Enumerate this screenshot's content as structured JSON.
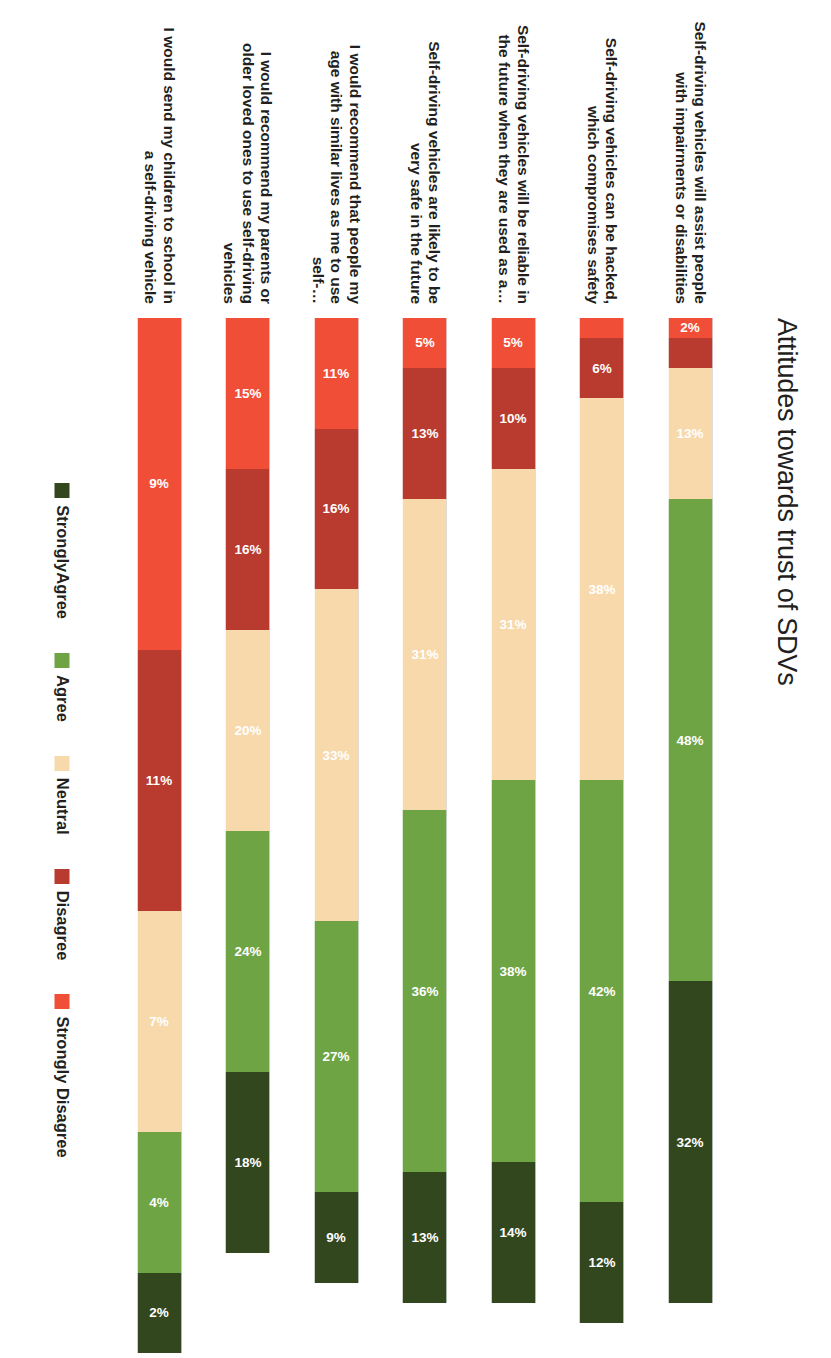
{
  "title": "Attitudes towards trust of SDVs",
  "legend": {
    "position": "bottom",
    "items": [
      {
        "label": "Strongly Disagree",
        "color": "#F04E37"
      },
      {
        "label": "Disagree",
        "color": "#B93A2E"
      },
      {
        "label": "Neutral",
        "color": "#F7D9AC"
      },
      {
        "label": "Agree",
        "color": "#6FA444"
      },
      {
        "label": "StronglyAgree",
        "color": "#33471F"
      }
    ]
  },
  "chart_data": {
    "type": "bar",
    "orientation": "stacked-horizontal-rotated",
    "title": "Attitudes towards trust of SDVs",
    "xlabel": "",
    "ylabel": "",
    "grid": false,
    "legend_position": "bottom",
    "value_suffix": "%",
    "categories": [
      "Self-driving vehicles will assist people with impairments or disabilities",
      "Self-driving vehicles can be hacked, which compromises safety",
      "Self-driving vehicles will be reliable in the future when they are used as a…",
      "Self-driving vehicles are likely to be very safe in the future",
      "I would recommend that people my age with similar lives as me to use self-…",
      "I would recommend my parents or older loved ones to use self-driving vehicles",
      "I would send my children to school in a self-driving vehicle"
    ],
    "series": [
      {
        "name": "Strongly Disagree",
        "color": "#F04E37",
        "values": [
          2,
          2,
          5,
          5,
          11,
          15,
          9
        ],
        "labels": [
          "2%",
          "2%",
          "5%",
          "5%",
          "11%",
          "15%",
          "9%"
        ]
      },
      {
        "name": "Disagree",
        "color": "#B93A2E",
        "values": [
          3,
          6,
          10,
          13,
          16,
          16,
          11
        ],
        "labels": [
          "",
          "6%",
          "10%",
          "13%",
          "16%",
          "16%",
          "11%"
        ]
      },
      {
        "name": "Neutral",
        "color": "#F7D9AC",
        "values": [
          13,
          38,
          31,
          31,
          33,
          20,
          7
        ],
        "labels": [
          "13%",
          "38%",
          "31%",
          "31%",
          "33%",
          "20%",
          "7%"
        ]
      },
      {
        "name": "Agree",
        "color": "#6FA444",
        "values": [
          48,
          42,
          38,
          36,
          27,
          24,
          4
        ],
        "labels": [
          "48%",
          "42%",
          "38%",
          "36%",
          "27%",
          "24%",
          "4%"
        ]
      },
      {
        "name": "StronglyAgree",
        "color": "#33471F",
        "values": [
          32,
          12,
          14,
          13,
          9,
          18,
          2
        ],
        "labels": [
          "32%",
          "12%",
          "14%",
          "13%",
          "9%",
          "18%",
          "2%"
        ]
      }
    ]
  },
  "rows": [
    {
      "label": "Self-driving vehicles will assist people with impairments or disabilities",
      "segments": [
        {
          "name": "Strongly Disagree",
          "color": "#F04E37",
          "value": 2,
          "label": "2%",
          "show": true
        },
        {
          "name": "Disagree",
          "color": "#B93A2E",
          "value": 3,
          "label": "",
          "show": false
        },
        {
          "name": "Neutral",
          "color": "#F7D9AC",
          "value": 13,
          "label": "13%",
          "show": true
        },
        {
          "name": "Agree",
          "color": "#6FA444",
          "value": 48,
          "label": "48%",
          "show": true
        },
        {
          "name": "StronglyAgree",
          "color": "#33471F",
          "value": 32,
          "label": "32%",
          "show": true
        }
      ]
    },
    {
      "label": "Self-driving vehicles can be hacked, which compromises safety",
      "segments": [
        {
          "name": "Strongly Disagree",
          "color": "#F04E37",
          "value": 2,
          "label": "2%",
          "show": false
        },
        {
          "name": "Disagree",
          "color": "#B93A2E",
          "value": 6,
          "label": "6%",
          "show": true
        },
        {
          "name": "Neutral",
          "color": "#F7D9AC",
          "value": 38,
          "label": "38%",
          "show": true
        },
        {
          "name": "Agree",
          "color": "#6FA444",
          "value": 42,
          "label": "42%",
          "show": true
        },
        {
          "name": "StronglyAgree",
          "color": "#33471F",
          "value": 12,
          "label": "12%",
          "show": true
        }
      ]
    },
    {
      "label": "Self-driving vehicles will be reliable in the future when they are used as a…",
      "segments": [
        {
          "name": "Strongly Disagree",
          "color": "#F04E37",
          "value": 5,
          "label": "5%",
          "show": true
        },
        {
          "name": "Disagree",
          "color": "#B93A2E",
          "value": 10,
          "label": "10%",
          "show": true
        },
        {
          "name": "Neutral",
          "color": "#F7D9AC",
          "value": 31,
          "label": "31%",
          "show": true
        },
        {
          "name": "Agree",
          "color": "#6FA444",
          "value": 38,
          "label": "38%",
          "show": true
        },
        {
          "name": "StronglyAgree",
          "color": "#33471F",
          "value": 14,
          "label": "14%",
          "show": true
        }
      ]
    },
    {
      "label": "Self-driving vehicles are likely to be very safe in the future",
      "segments": [
        {
          "name": "Strongly Disagree",
          "color": "#F04E37",
          "value": 5,
          "label": "5%",
          "show": true
        },
        {
          "name": "Disagree",
          "color": "#B93A2E",
          "value": 13,
          "label": "13%",
          "show": true
        },
        {
          "name": "Neutral",
          "color": "#F7D9AC",
          "value": 31,
          "label": "31%",
          "show": true
        },
        {
          "name": "Agree",
          "color": "#6FA444",
          "value": 36,
          "label": "36%",
          "show": true
        },
        {
          "name": "StronglyAgree",
          "color": "#33471F",
          "value": 13,
          "label": "13%",
          "show": true
        }
      ]
    },
    {
      "label": "I would recommend that people my age with similar lives as me to use self-…",
      "segments": [
        {
          "name": "Strongly Disagree",
          "color": "#F04E37",
          "value": 11,
          "label": "11%",
          "show": true
        },
        {
          "name": "Disagree",
          "color": "#B93A2E",
          "value": 16,
          "label": "16%",
          "show": true
        },
        {
          "name": "Neutral",
          "color": "#F7D9AC",
          "value": 33,
          "label": "33%",
          "show": true
        },
        {
          "name": "Agree",
          "color": "#6FA444",
          "value": 27,
          "label": "27%",
          "show": true
        },
        {
          "name": "StronglyAgree",
          "color": "#33471F",
          "value": 9,
          "label": "9%",
          "show": true
        }
      ]
    },
    {
      "label": "I would recommend my parents or older loved ones to use self-driving vehicles",
      "segments": [
        {
          "name": "Strongly Disagree",
          "color": "#F04E37",
          "value": 15,
          "label": "15%",
          "show": true
        },
        {
          "name": "Disagree",
          "color": "#B93A2E",
          "value": 16,
          "label": "16%",
          "show": true
        },
        {
          "name": "Neutral",
          "color": "#F7D9AC",
          "value": 20,
          "label": "20%",
          "show": true
        },
        {
          "name": "Agree",
          "color": "#6FA444",
          "value": 24,
          "label": "24%",
          "show": true
        },
        {
          "name": "StronglyAgree",
          "color": "#33471F",
          "value": 18,
          "label": "18%",
          "show": true
        }
      ]
    },
    {
      "label": "I would send my children to school in a self-driving vehicle",
      "segments": [
        {
          "name": "Strongly Disagree",
          "color": "#F04E37",
          "value": 33,
          "label": "9%",
          "show": true
        },
        {
          "name": "Disagree",
          "color": "#B93A2E",
          "value": 26,
          "label": "11%",
          "show": true
        },
        {
          "name": "Neutral",
          "color": "#F7D9AC",
          "value": 22,
          "label": "7%",
          "show": true
        },
        {
          "name": "Agree",
          "color": "#6FA444",
          "value": 14,
          "label": "4%",
          "show": true
        },
        {
          "name": "StronglyAgree",
          "color": "#33471F",
          "value": 8,
          "label": "2%",
          "show": true
        }
      ]
    }
  ]
}
